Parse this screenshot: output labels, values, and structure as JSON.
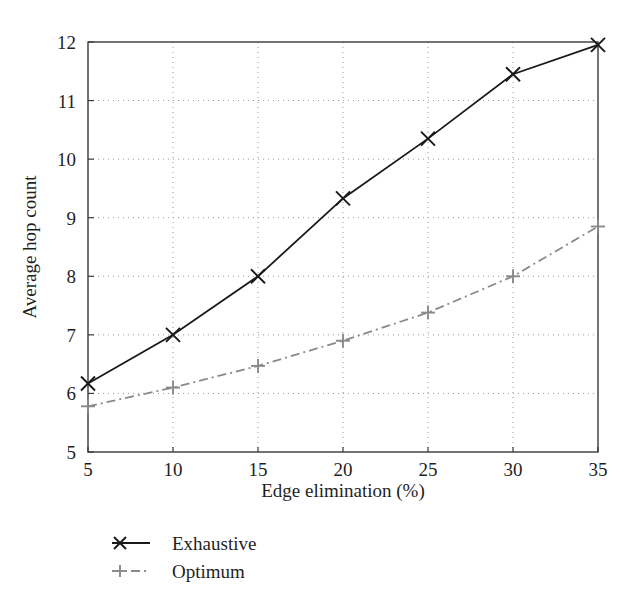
{
  "chart_data": {
    "type": "line",
    "title": "",
    "xlabel": "Edge elimination (%)",
    "ylabel": "Average hop count",
    "x": [
      5,
      10,
      15,
      20,
      25,
      30,
      35
    ],
    "xlim": [
      5,
      35
    ],
    "ylim": [
      5,
      12
    ],
    "xticks": [
      "5",
      "10",
      "15",
      "20",
      "25",
      "30",
      "35"
    ],
    "yticks": [
      "5",
      "6",
      "7",
      "8",
      "9",
      "10",
      "11",
      "12"
    ],
    "grid": "dotted-both",
    "legend_position": "below-left",
    "series": [
      {
        "name": "Exhaustive",
        "marker": "x",
        "linestyle": "solid",
        "color": "#1a1a1a",
        "values": [
          6.17,
          7.0,
          8.0,
          9.33,
          10.35,
          11.45,
          11.95
        ]
      },
      {
        "name": "Optimum",
        "marker": "plus",
        "linestyle": "dash-dot",
        "color": "#8a8a8a",
        "values": [
          5.78,
          6.1,
          6.47,
          6.9,
          7.38,
          8.0,
          8.85
        ]
      }
    ]
  },
  "axes": {
    "x_title": "Edge elimination (%)",
    "y_title": "Average hop count",
    "x_tick_labels": [
      "5",
      "10",
      "15",
      "20",
      "25",
      "30",
      "35"
    ],
    "y_tick_labels": [
      "5",
      "6",
      "7",
      "8",
      "9",
      "10",
      "11",
      "12"
    ]
  },
  "legend": {
    "items": [
      {
        "label": "Exhaustive",
        "marker": "x-marker",
        "style": "solid"
      },
      {
        "label": "Optimum",
        "marker": "plus-marker",
        "style": "dash-dot"
      }
    ]
  },
  "colors": {
    "background": "#ffffff",
    "axis": "#3a3a3a",
    "grid": "#9a9a9a",
    "exhaustive": "#1a1a1a",
    "optimum": "#8a8a8a"
  }
}
